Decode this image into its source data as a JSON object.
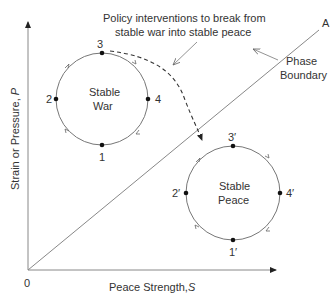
{
  "diagram": {
    "annotation": {
      "line1": "Policy interventions to break from",
      "line2": "stable war into stable peace"
    },
    "phase_boundary": {
      "endpoint_label": "A",
      "label_line1": "Phase",
      "label_line2": "Boundary"
    },
    "axes": {
      "origin_label": "0",
      "x_label": "Peace Strength,",
      "x_symbol": "S",
      "y_label": "Strain or Pressure,",
      "y_symbol": "P"
    },
    "stable_war": {
      "title_line1": "Stable",
      "title_line2": "War",
      "points": [
        "1",
        "2",
        "3",
        "4"
      ],
      "flow_direction": "clockwise"
    },
    "stable_peace": {
      "title_line1": "Stable",
      "title_line2": "Peace",
      "points": [
        "1′",
        "2′",
        "3′",
        "4′"
      ],
      "flow_direction": "clockwise"
    },
    "colors": {
      "line": "#777777",
      "text": "#333333",
      "point": "#111111"
    }
  }
}
